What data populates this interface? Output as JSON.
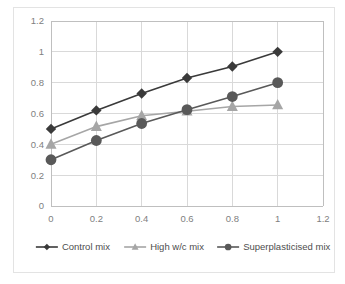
{
  "chart_data": {
    "type": "line",
    "title": "",
    "xlabel": "",
    "ylabel": "",
    "xlim": [
      0,
      1.2
    ],
    "ylim": [
      0,
      1.2
    ],
    "grid": true,
    "legend_position": "bottom",
    "x": [
      0,
      0.2,
      0.4,
      0.6,
      0.8,
      1
    ],
    "xticks": [
      "0",
      "0.2",
      "0.4",
      "0.6",
      "0.8",
      "1",
      "1.2"
    ],
    "xtick_values": [
      0,
      0.2,
      0.4,
      0.6,
      0.8,
      1,
      1.2
    ],
    "yticks": [
      "0",
      "0.2",
      "0.4",
      "0.6",
      "0.8",
      "1",
      "1.2"
    ],
    "ytick_values": [
      0,
      0.2,
      0.4,
      0.6,
      0.8,
      1,
      1.2
    ],
    "series": [
      {
        "name": "Control mix",
        "color": "#3a3a3a",
        "marker": "diamond",
        "values": [
          0.5,
          0.62,
          0.73,
          0.83,
          0.905,
          1.0
        ]
      },
      {
        "name": "High w/c mix",
        "color": "#a6a6a6",
        "marker": "triangle",
        "values": [
          0.4,
          0.515,
          0.585,
          0.615,
          0.645,
          0.655
        ]
      },
      {
        "name": "Superplasticised mix",
        "color": "#595959",
        "marker": "circle",
        "values": [
          0.3,
          0.425,
          0.535,
          0.625,
          0.71,
          0.8
        ]
      }
    ]
  },
  "legend": {
    "items": [
      {
        "label": "Control mix"
      },
      {
        "label": "High w/c mix"
      },
      {
        "label": "Superplasticised mix"
      }
    ]
  },
  "colors": {
    "grid": "#d9d9d9",
    "axis": "#bfbfbf",
    "tick_text": "#808080",
    "legend_text": "#4d4d4d",
    "border": "#e3e3e3",
    "background": "#ffffff"
  }
}
